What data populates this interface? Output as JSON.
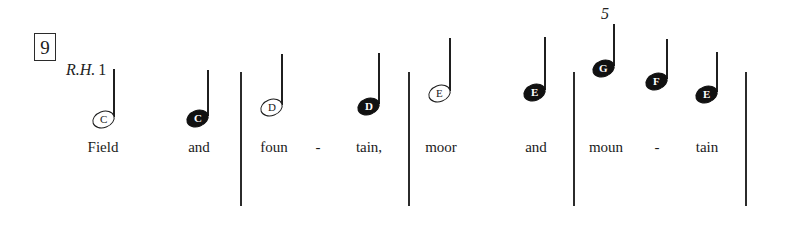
{
  "score": {
    "measure_number": "9",
    "hand_indication": {
      "hand": "R.H.",
      "finger": "1"
    },
    "lyric_line": "Field and foun - tain, moor and moun - tain",
    "notes": [
      {
        "letter": "C",
        "head": "hollow",
        "lyric": "Field",
        "finger": "",
        "x": 92,
        "y": 111,
        "stem_height": 48
      },
      {
        "letter": "C",
        "head": "filled",
        "lyric": "and",
        "finger": "",
        "x": 186,
        "y": 110,
        "stem_height": 46
      },
      {
        "letter": "D",
        "head": "hollow",
        "lyric": "foun",
        "finger": "",
        "x": 260,
        "y": 99,
        "stem_height": 51
      },
      {
        "letter": "D",
        "head": "filled",
        "lyric": "tain,",
        "finger": "",
        "x": 357,
        "y": 98,
        "stem_height": 51
      },
      {
        "letter": "E",
        "head": "hollow",
        "lyric": "moor",
        "finger": "",
        "x": 428,
        "y": 85,
        "stem_height": 53
      },
      {
        "letter": "E",
        "head": "filled",
        "lyric": "and",
        "finger": "",
        "x": 523,
        "y": 84,
        "stem_height": 53
      },
      {
        "letter": "G",
        "head": "filled",
        "lyric": "moun",
        "finger": "5",
        "x": 592,
        "y": 60,
        "stem_height": 42
      },
      {
        "letter": "F",
        "head": "filled",
        "lyric": "tain",
        "finger": "",
        "x": 645,
        "y": 73,
        "stem_height": 40
      },
      {
        "letter": "E",
        "head": "filled",
        "lyric": "",
        "finger": "",
        "x": 695,
        "y": 86,
        "stem_height": 40
      }
    ],
    "hyphens": [
      {
        "label": "-",
        "x": 318
      },
      {
        "label": "-",
        "x": 657
      }
    ],
    "lyrics": [
      {
        "text": "Field",
        "x": 103
      },
      {
        "text": "and",
        "x": 199
      },
      {
        "text": "foun",
        "x": 274
      },
      {
        "text": "tain,",
        "x": 369
      },
      {
        "text": "moor",
        "x": 441
      },
      {
        "text": "and",
        "x": 536
      },
      {
        "text": "moun",
        "x": 606
      },
      {
        "text": "tain",
        "x": 707
      }
    ],
    "barlines": [
      {
        "x": 240,
        "top": 72,
        "height": 134
      },
      {
        "x": 408,
        "top": 72,
        "height": 134
      },
      {
        "x": 573,
        "top": 72,
        "height": 134
      },
      {
        "x": 745,
        "top": 72,
        "height": 134
      }
    ],
    "colors": {
      "ink": "#1a1a1a",
      "paper": "#ffffff"
    }
  }
}
